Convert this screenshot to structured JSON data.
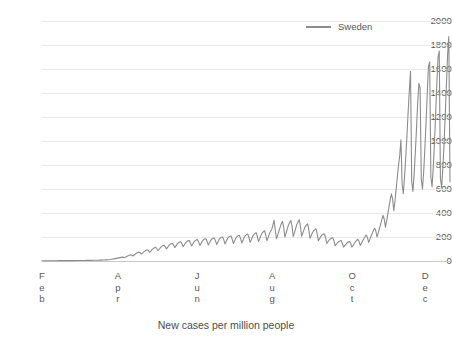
{
  "chart_data": {
    "type": "line",
    "title": "",
    "xlabel": "New cases per million people",
    "ylabel": "",
    "ylim": [
      0,
      2000
    ],
    "ytick_labels": [
      "2000",
      "1800",
      "1600",
      "1400",
      "1200",
      "1000",
      "800",
      "600",
      "400",
      "200",
      "0"
    ],
    "ytick_values": [
      2000,
      1800,
      1600,
      1400,
      1200,
      1000,
      800,
      600,
      400,
      200,
      0
    ],
    "xtick_labels": [
      "Feb",
      "Apr",
      "Jun",
      "Aug",
      "Oct",
      "Dec"
    ],
    "xtick_letters": [
      [
        "F",
        "e",
        "b"
      ],
      [
        "A",
        "p",
        "r"
      ],
      [
        "J",
        "u",
        "n"
      ],
      [
        "A",
        "u",
        "g"
      ],
      [
        "O",
        "c",
        "t"
      ],
      [
        "D",
        "e",
        "c"
      ]
    ],
    "xtick_positions_frac": [
      0.0,
      0.186,
      0.38,
      0.564,
      0.76,
      0.939
    ],
    "grid": true,
    "grid_axis": "y",
    "legend": {
      "position": "top-right",
      "entries": [
        "Sweden"
      ]
    },
    "series": [
      {
        "name": "Sweden",
        "color": "#8c8c8c",
        "x_start_label": "Feb",
        "x_end_label": "Dec",
        "n_points": 320,
        "values": [
          2,
          2,
          2,
          2,
          2,
          2,
          2,
          2,
          2,
          2,
          2,
          2,
          2,
          2,
          3,
          3,
          3,
          3,
          3,
          3,
          3,
          3,
          3,
          3,
          3,
          3,
          3,
          3,
          3,
          4,
          4,
          4,
          4,
          4,
          4,
          4,
          4,
          5,
          5,
          5,
          5,
          5,
          5,
          6,
          6,
          6,
          6,
          6,
          7,
          7,
          7,
          8,
          8,
          9,
          9,
          10,
          11,
          12,
          14,
          16,
          18,
          20,
          22,
          24,
          26,
          28,
          30,
          32,
          30,
          28,
          34,
          40,
          44,
          48,
          52,
          48,
          42,
          50,
          58,
          64,
          70,
          74,
          68,
          58,
          66,
          76,
          84,
          90,
          94,
          86,
          72,
          82,
          94,
          104,
          110,
          114,
          102,
          86,
          98,
          112,
          122,
          128,
          132,
          118,
          100,
          114,
          128,
          138,
          144,
          148,
          132,
          112,
          126,
          142,
          152,
          158,
          160,
          142,
          120,
          136,
          152,
          162,
          168,
          170,
          150,
          126,
          142,
          160,
          170,
          176,
          178,
          156,
          130,
          148,
          166,
          178,
          184,
          186,
          162,
          134,
          152,
          172,
          184,
          190,
          192,
          168,
          138,
          158,
          178,
          192,
          198,
          200,
          174,
          142,
          164,
          186,
          200,
          206,
          208,
          180,
          146,
          168,
          190,
          204,
          212,
          214,
          186,
          150,
          172,
          196,
          212,
          220,
          224,
          194,
          156,
          178,
          204,
          220,
          230,
          236,
          204,
          162,
          186,
          214,
          232,
          244,
          252,
          216,
          170,
          196,
          226,
          248,
          262,
          300,
          340,
          254,
          186,
          214,
          250,
          280,
          310,
          330,
          280,
          200,
          230,
          268,
          300,
          320,
          338,
          286,
          204,
          234,
          272,
          304,
          326,
          344,
          290,
          206,
          232,
          262,
          286,
          300,
          310,
          262,
          190,
          212,
          236,
          252,
          262,
          268,
          228,
          168,
          186,
          204,
          216,
          222,
          226,
          194,
          146,
          160,
          174,
          184,
          190,
          194,
          168,
          128,
          140,
          152,
          160,
          166,
          170,
          148,
          116,
          128,
          140,
          150,
          158,
          164,
          146,
          116,
          130,
          146,
          160,
          172,
          182,
          164,
          130,
          148,
          168,
          186,
          202,
          216,
          196,
          156,
          180,
          206,
          230,
          254,
          274,
          250,
          200,
          232,
          270,
          306,
          344,
          380,
          350,
          282,
          330,
          390,
          450,
          510,
          560,
          520,
          420,
          500,
          600,
          700,
          800,
          880,
          1010,
          640,
          560,
          700,
          860,
          1040,
          1240,
          1420,
          1580,
          660,
          580,
          720,
          900,
          1100,
          1320,
          1480,
          1440,
          680,
          600,
          740,
          940,
          1160,
          1400,
          1620,
          1660,
          700,
          620,
          780,
          980,
          1220,
          1480,
          1700,
          1750,
          690,
          610,
          770,
          970,
          1210,
          1470,
          1720,
          1870,
          660
        ]
      }
    ]
  },
  "legend": {
    "series_label": "Sweden",
    "swatch_color": "#8c8c8c"
  },
  "axes": {
    "x_title": "New cases per million people"
  },
  "colors": {
    "line": "#8c8c8c",
    "grid": "#e9e9e9",
    "axis_text": "#595959",
    "background": "#ffffff"
  }
}
